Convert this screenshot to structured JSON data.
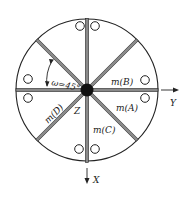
{
  "diagram": {
    "type": "rotor-cross-section",
    "colors": {
      "stroke": "#222222",
      "bar_fill": "#8a8a8a",
      "background": "#ffffff"
    },
    "labels": {
      "angle": "ω=45°",
      "mass_a": "m(A)",
      "mass_b": "m(B)",
      "mass_c": "m(C)",
      "mass_d": "m(D)",
      "axis_z": "Z",
      "axis_y": "Y",
      "axis_x": "X"
    },
    "spokes": 8,
    "holes": 8
  }
}
